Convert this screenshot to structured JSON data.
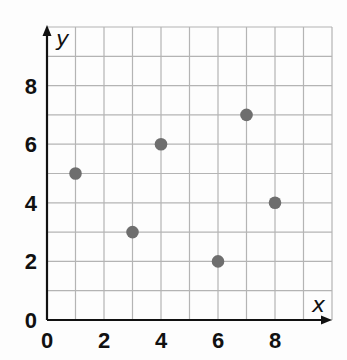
{
  "chart_data": {
    "type": "scatter",
    "title": "",
    "xlabel": "x",
    "ylabel": "y",
    "xlim": [
      0,
      10
    ],
    "ylim": [
      0,
      10
    ],
    "grid": true,
    "x_ticks": [
      "0",
      "2",
      "4",
      "6",
      "8"
    ],
    "y_ticks": [
      "0",
      "2",
      "4",
      "6",
      "8"
    ],
    "series": [
      {
        "name": "points",
        "color": "#6e6e6e",
        "points": [
          {
            "x": 1,
            "y": 5
          },
          {
            "x": 3,
            "y": 3
          },
          {
            "x": 4,
            "y": 6
          },
          {
            "x": 6,
            "y": 2
          },
          {
            "x": 7,
            "y": 7
          },
          {
            "x": 8,
            "y": 4
          }
        ]
      }
    ]
  },
  "colors": {
    "grid": "#b4b4b4",
    "axis": "#111111",
    "point": "#6e6e6e"
  }
}
